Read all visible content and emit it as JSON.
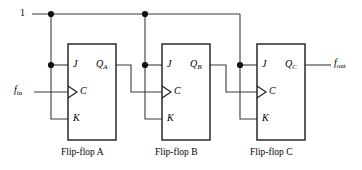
{
  "diagram": {
    "type": "logic-circuit",
    "supply": {
      "label": "1"
    },
    "signals": {
      "input": {
        "base": "f",
        "sub": "in"
      },
      "output": {
        "base": "f",
        "sub": "out"
      }
    },
    "flipflops": [
      {
        "id": "A",
        "caption": "Flip-flop A",
        "pins": {
          "j": "J",
          "c": "C",
          "k": "K"
        },
        "output": {
          "base": "Q",
          "sub": "A"
        }
      },
      {
        "id": "B",
        "caption": "Flip-flop B",
        "pins": {
          "j": "J",
          "c": "C",
          "k": "K"
        },
        "output": {
          "base": "Q",
          "sub": "B"
        }
      },
      {
        "id": "C",
        "caption": "Flip-flop C",
        "pins": {
          "j": "J",
          "c": "C",
          "k": "K"
        },
        "output": {
          "base": "Q",
          "sub": "C"
        }
      }
    ],
    "colors": {
      "wire": "#3b3b3b",
      "box": "#1a1a1a",
      "junction": "#111111",
      "text": "#000000",
      "background": "#ffffff"
    }
  }
}
